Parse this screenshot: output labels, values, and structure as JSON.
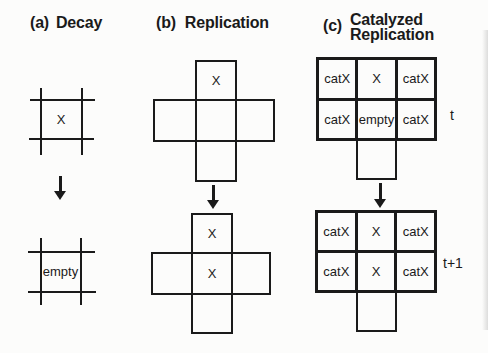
{
  "colors": {
    "ink": "#1a1a1a",
    "paper": "#fcfcfb"
  },
  "panel_a": {
    "label": "(a)",
    "title": "Decay",
    "state_t": "X",
    "state_t1": "empty"
  },
  "panel_b": {
    "label": "(b)",
    "title": "Replication",
    "state_t": {
      "top": "X"
    },
    "state_t1": {
      "top": "X",
      "center": "X"
    }
  },
  "panel_c": {
    "label": "(c)",
    "title_line1": "Catalyzed",
    "title_line2": "Replication",
    "grid_t": {
      "row1": [
        "catX",
        "X",
        "catX"
      ],
      "row2": [
        "catX",
        "empty",
        "catX"
      ],
      "time": "t"
    },
    "grid_t1": {
      "row1": [
        "catX",
        "X",
        "catX"
      ],
      "row2": [
        "catX",
        "X",
        "catX"
      ],
      "time": "t+1"
    }
  }
}
